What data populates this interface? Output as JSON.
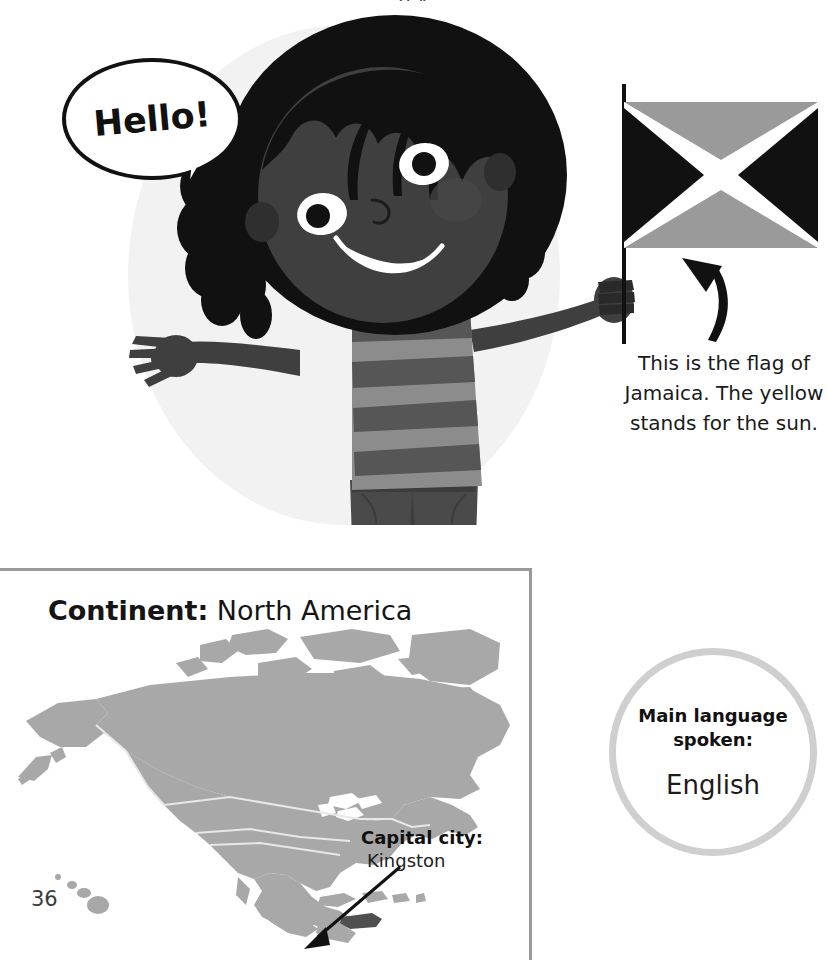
{
  "page": {
    "number": "36",
    "background_color": "#ffffff"
  },
  "speech_bubble": {
    "text": "Hello!"
  },
  "flag": {
    "caption": "This is the flag of Jamaica. The yellow stands for the sun.",
    "arrow_icon": "curved-up-arrow-icon",
    "colors": {
      "top_bottom_triangles": "#9a9a9a",
      "left_right_triangles": "#111111",
      "saltire_cross": "#ffffff",
      "pole": "#111111"
    }
  },
  "illustration": {
    "subject": "girl-waving-with-jamaican-flag",
    "background_circle_color": "#f2f2f2",
    "skin_color": "#3f3f3f",
    "hair_color": "#111111",
    "shirt_light_stripe": "#8c8c8c",
    "shirt_dark_stripe": "#565656",
    "shorts_color": "#4a4a4a",
    "eye_white": "#ffffff",
    "teeth_color": "#ffffff"
  },
  "continent_panel": {
    "label": "Continent:",
    "value": "North America",
    "border_color": "#9a9a9a",
    "map": {
      "landmass_color": "#a8a8a8",
      "border_line_color": "#e8e8e8",
      "highlight_color": "#4f4f4f",
      "highlighted_country": "Jamaica",
      "regions": [
        "North America",
        "Hawaii"
      ]
    },
    "capital": {
      "label": "Capital city:",
      "value": "Kingston",
      "pointer_icon": "arrow-pointer-icon"
    }
  },
  "language": {
    "label_line1": "Main language",
    "label_line2": "spoken:",
    "value": "English",
    "ring_color": "#cfcfcf"
  }
}
